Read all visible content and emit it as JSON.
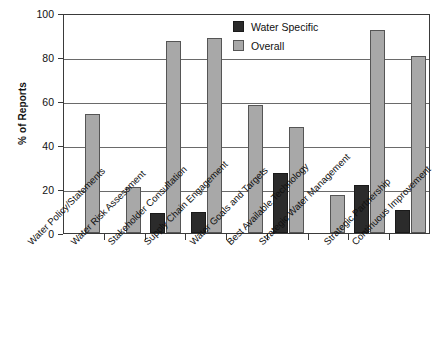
{
  "chart_data": {
    "type": "bar",
    "title": "",
    "xlabel": "",
    "ylabel": "% of Reports",
    "ylim": [
      0,
      100
    ],
    "yticks": [
      0,
      20,
      40,
      60,
      80,
      100
    ],
    "grid": true,
    "legend_position": "top-right",
    "categories": [
      "Water Policy/Statements",
      "Water Risk Assessment",
      "Stakeholder Consultation",
      "Supply Chain Engagement",
      "Water Goals and Targets",
      "Best Available Technology",
      "Strategic Water Management",
      "Strategic Partnership",
      "Continuous Improvement"
    ],
    "series": [
      {
        "name": "Water Specific",
        "color": "#2b2b2b",
        "values": [
          0,
          0,
          9,
          9.5,
          0,
          27.5,
          0,
          22,
          10.5
        ]
      },
      {
        "name": "Overall",
        "color": "#a8a8a8",
        "values": [
          54,
          20.7,
          87.5,
          88.5,
          58,
          48,
          17.5,
          92.3,
          80.5
        ]
      }
    ]
  },
  "axis": {
    "y_title": "% of Reports",
    "y_tick_labels": [
      "0",
      "20",
      "40",
      "60",
      "80",
      "100"
    ]
  },
  "legend": {
    "items": [
      {
        "label": "Water Specific",
        "swatch": "specific"
      },
      {
        "label": "Overall",
        "swatch": "overall"
      }
    ]
  }
}
